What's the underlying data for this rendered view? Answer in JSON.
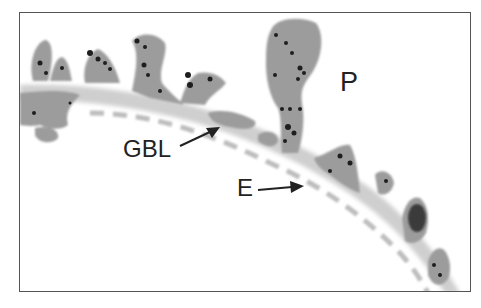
{
  "figure": {
    "labels": {
      "p": "P",
      "gbl": "GBL",
      "e": "E"
    },
    "colors": {
      "background": "#ffffff",
      "tissue": "#9a9a9a",
      "membrane": "#c8c8c8",
      "granules": "#1e1e1e",
      "frame": "#555555"
    }
  }
}
